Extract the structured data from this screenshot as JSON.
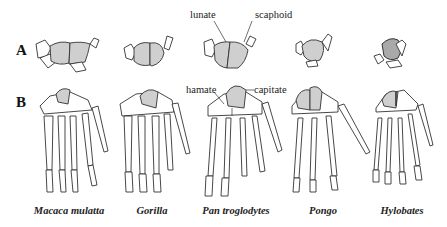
{
  "figure": {
    "rows": [
      {
        "letter": "A",
        "description": "proximal carpal row"
      },
      {
        "letter": "B",
        "description": "dorsal view of hand skeleton"
      }
    ],
    "annotations": {
      "lunate": "lunate",
      "scaphoid": "scaphoid",
      "hamate": "hamate",
      "capitate": "capitate"
    },
    "species": [
      {
        "name": "Macaca mulatta"
      },
      {
        "name": "Gorilla"
      },
      {
        "name": "Pan troglodytes"
      },
      {
        "name": "Pongo"
      },
      {
        "name": "Hylobates"
      }
    ]
  }
}
